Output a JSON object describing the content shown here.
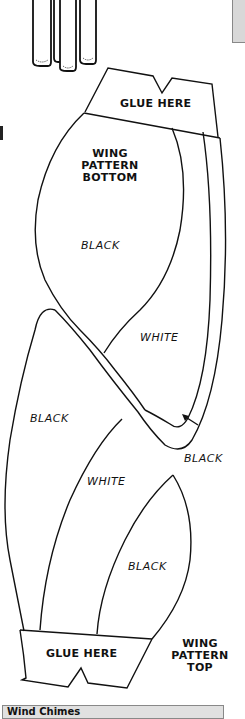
{
  "figure": {
    "top_tab": "GLUE HERE",
    "bottom_piece_title": [
      "WING",
      "PATTERN",
      "BOTTOM"
    ],
    "top_piece_title": [
      "WING",
      "PATTERN",
      "TOP"
    ],
    "bottom_tab": "GLUE HERE",
    "regions": {
      "upper_black": "BLACK",
      "upper_white": "WHITE",
      "left_black": "BLACK",
      "pointer_black": "BLACK",
      "lower_white": "WHITE",
      "lower_black": "BLACK"
    }
  },
  "footer": {
    "section_title": "Wind Chimes"
  }
}
